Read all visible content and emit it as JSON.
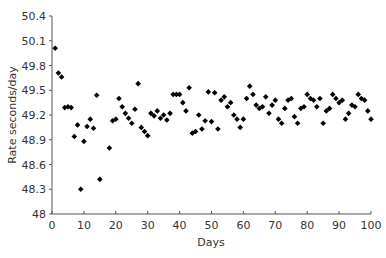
{
  "chart_data": {
    "type": "scatter",
    "title": "",
    "xlabel": "Days",
    "ylabel": "Rate seconds/day",
    "xlim": [
      0,
      100
    ],
    "ylim": [
      48,
      50.4
    ],
    "xticks": [
      0,
      10,
      20,
      30,
      40,
      50,
      60,
      70,
      80,
      90,
      100
    ],
    "yticks": [
      48,
      48.3,
      48.6,
      48.9,
      49.2,
      49.5,
      49.8,
      50.1,
      50.4
    ],
    "ytick_labels": [
      "48",
      "48.3",
      "48.6",
      "48.9",
      "49.2",
      "49.5",
      "49.8",
      "50.1",
      "50.4"
    ],
    "grid": false,
    "legend": null,
    "marker": "diamond",
    "marker_color": "#000000",
    "points": [
      [
        1,
        50.01
      ],
      [
        2,
        49.71
      ],
      [
        3,
        49.66
      ],
      [
        4,
        49.29
      ],
      [
        5,
        49.3
      ],
      [
        6,
        49.29
      ],
      [
        7,
        48.94
      ],
      [
        8,
        49.08
      ],
      [
        9,
        48.3
      ],
      [
        10,
        48.88
      ],
      [
        11,
        49.06
      ],
      [
        12,
        49.15
      ],
      [
        13,
        49.04
      ],
      [
        14,
        49.44
      ],
      [
        15,
        48.42
      ],
      [
        18,
        48.8
      ],
      [
        19,
        49.13
      ],
      [
        20,
        49.15
      ],
      [
        21,
        49.4
      ],
      [
        22,
        49.3
      ],
      [
        23,
        49.22
      ],
      [
        24,
        49.16
      ],
      [
        25,
        49.1
      ],
      [
        26,
        49.27
      ],
      [
        27,
        49.58
      ],
      [
        28,
        49.05
      ],
      [
        29,
        49.0
      ],
      [
        30,
        48.95
      ],
      [
        31,
        49.22
      ],
      [
        32,
        49.19
      ],
      [
        33,
        49.25
      ],
      [
        34,
        49.16
      ],
      [
        35,
        49.2
      ],
      [
        36,
        49.14
      ],
      [
        37,
        49.22
      ],
      [
        38,
        49.45
      ],
      [
        39,
        49.45
      ],
      [
        40,
        49.45
      ],
      [
        41,
        49.35
      ],
      [
        42,
        49.25
      ],
      [
        43,
        49.53
      ],
      [
        44,
        48.98
      ],
      [
        45,
        49.0
      ],
      [
        46,
        49.2
      ],
      [
        47,
        49.03
      ],
      [
        48,
        49.13
      ],
      [
        49,
        49.48
      ],
      [
        50,
        49.12
      ],
      [
        51,
        49.47
      ],
      [
        52,
        49.03
      ],
      [
        53,
        49.38
      ],
      [
        54,
        49.42
      ],
      [
        55,
        49.3
      ],
      [
        56,
        49.35
      ],
      [
        57,
        49.2
      ],
      [
        58,
        49.15
      ],
      [
        59,
        49.05
      ],
      [
        60,
        49.15
      ],
      [
        61,
        49.4
      ],
      [
        62,
        49.55
      ],
      [
        63,
        49.45
      ],
      [
        64,
        49.32
      ],
      [
        65,
        49.28
      ],
      [
        66,
        49.3
      ],
      [
        67,
        49.42
      ],
      [
        68,
        49.22
      ],
      [
        69,
        49.32
      ],
      [
        70,
        49.38
      ],
      [
        71,
        49.15
      ],
      [
        72,
        49.1
      ],
      [
        73,
        49.28
      ],
      [
        74,
        49.38
      ],
      [
        75,
        49.4
      ],
      [
        76,
        49.18
      ],
      [
        77,
        49.1
      ],
      [
        78,
        49.28
      ],
      [
        79,
        49.3
      ],
      [
        80,
        49.45
      ],
      [
        81,
        49.4
      ],
      [
        82,
        49.38
      ],
      [
        83,
        49.3
      ],
      [
        84,
        49.4
      ],
      [
        85,
        49.1
      ],
      [
        86,
        49.25
      ],
      [
        87,
        49.28
      ],
      [
        88,
        49.45
      ],
      [
        89,
        49.4
      ],
      [
        90,
        49.35
      ],
      [
        91,
        49.38
      ],
      [
        92,
        49.15
      ],
      [
        93,
        49.22
      ],
      [
        94,
        49.32
      ],
      [
        95,
        49.3
      ],
      [
        96,
        49.45
      ],
      [
        97,
        49.4
      ],
      [
        98,
        49.38
      ],
      [
        99,
        49.25
      ],
      [
        100,
        49.15
      ]
    ]
  }
}
